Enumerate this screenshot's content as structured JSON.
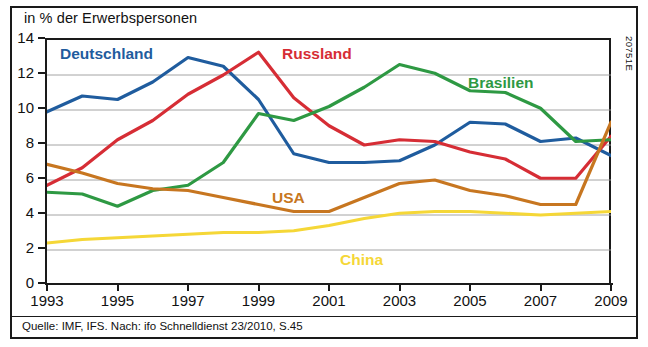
{
  "figure": {
    "axis_title": "in % der Erwerbspersonen",
    "source": "Quelle: IMF, IFS. Nach: ifo Schnelldienst 23/2010, S.45",
    "code": "20751E"
  },
  "chart_data": {
    "type": "line",
    "title": "in % der Erwerbspersonen",
    "xlabel": "",
    "ylabel": "in % der Erwerbspersonen",
    "xlim": [
      1993,
      2009
    ],
    "ylim": [
      0,
      14
    ],
    "ytick_values": [
      0,
      2,
      4,
      6,
      8,
      10,
      12,
      14
    ],
    "ytick_labels": [
      "0",
      "2",
      "4",
      "6",
      "8",
      "10",
      "12",
      "14"
    ],
    "xtick_values": [
      1993,
      1995,
      1997,
      1999,
      2001,
      2003,
      2005,
      2007,
      2009
    ],
    "xtick_labels": [
      "1993",
      "1995",
      "1997",
      "1999",
      "2001",
      "2003",
      "2005",
      "2007",
      "2009"
    ],
    "x": [
      1993,
      1994,
      1995,
      1996,
      1997,
      1998,
      1999,
      2000,
      2001,
      2002,
      2003,
      2004,
      2005,
      2006,
      2007,
      2008,
      2009
    ],
    "grid": "horizontal",
    "legend": "inline-labels",
    "series": [
      {
        "name": "Deutschland",
        "color": "#1F5C9E",
        "label_x": 60,
        "label_y": 46,
        "values": [
          9.9,
          10.8,
          10.6,
          11.6,
          13.0,
          12.5,
          10.6,
          7.5,
          7.0,
          7.0,
          7.1,
          8.0,
          9.3,
          9.2,
          8.2,
          8.4,
          7.4
        ]
      },
      {
        "name": "Russland",
        "color": "#D62D35",
        "label_x": 282,
        "label_y": 46,
        "values": [
          5.7,
          6.7,
          8.3,
          9.4,
          10.9,
          12.0,
          13.3,
          10.7,
          9.1,
          8.0,
          8.3,
          8.2,
          7.6,
          7.2,
          6.1,
          6.1,
          8.5
        ]
      },
      {
        "name": "Brasilien",
        "color": "#2E9943",
        "label_x": 468,
        "label_y": 75,
        "values": [
          5.3,
          5.2,
          4.5,
          5.4,
          5.7,
          7.0,
          9.8,
          9.4,
          10.2,
          11.3,
          12.6,
          12.1,
          11.1,
          11.0,
          10.1,
          8.2,
          8.3
        ]
      },
      {
        "name": "USA",
        "color": "#C77620",
        "label_x": 272,
        "label_y": 190,
        "values": [
          6.9,
          6.4,
          5.8,
          5.5,
          5.4,
          5.0,
          4.6,
          4.2,
          4.2,
          5.0,
          5.8,
          6.0,
          5.4,
          5.1,
          4.6,
          4.6,
          9.3
        ]
      },
      {
        "name": "China",
        "color": "#F5D737",
        "label_x": 340,
        "label_y": 252,
        "values": [
          2.4,
          2.6,
          2.7,
          2.8,
          2.9,
          3.0,
          3.0,
          3.1,
          3.4,
          3.8,
          4.1,
          4.2,
          4.2,
          4.1,
          4.0,
          4.1,
          4.2
        ]
      }
    ]
  }
}
